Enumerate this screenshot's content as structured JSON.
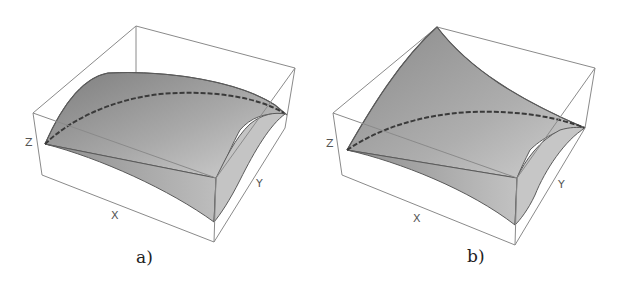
{
  "figure": {
    "panels": [
      {
        "id": "a",
        "caption": "a)",
        "axes": {
          "x": "X",
          "y": "Y",
          "z": "Z"
        },
        "surface": "concave-down dome (paraboloid cap)",
        "surface_color_light": "#cdcdcd",
        "surface_color_dark": "#7e7e7e"
      },
      {
        "id": "b",
        "caption": "b)",
        "axes": {
          "x": "X",
          "y": "Y",
          "z": "Z"
        },
        "surface": "saddle-like surface rising to back corner",
        "surface_color_light": "#cdcdcd",
        "surface_color_dark": "#7e7e7e"
      }
    ],
    "box_color": "#8a8a8a",
    "curve_color": "#3a3a3a"
  }
}
